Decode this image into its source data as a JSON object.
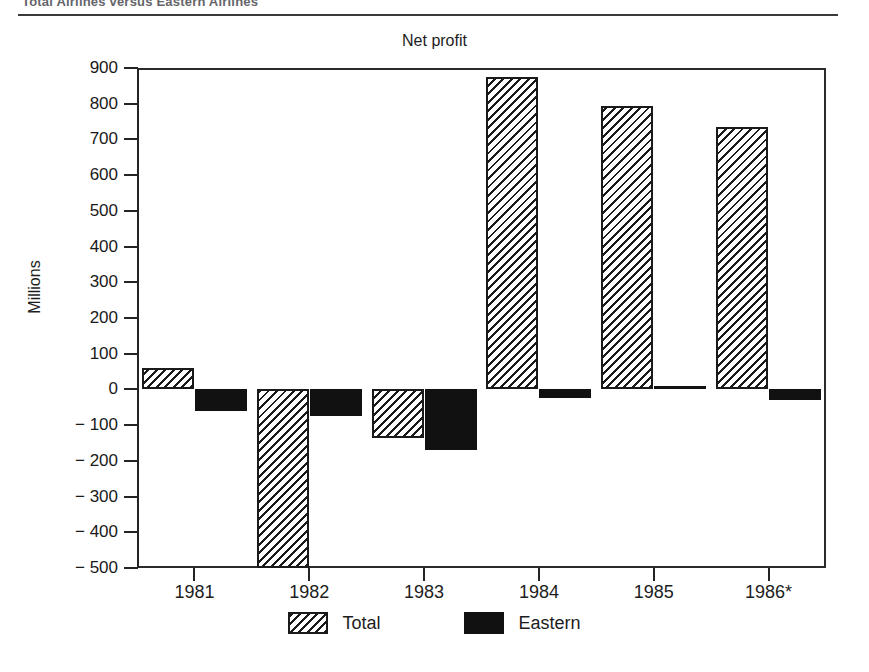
{
  "header": {
    "running_title": "Total Airlines versus Eastern Airlines"
  },
  "chart_data": {
    "type": "bar",
    "title": "Net profit",
    "xlabel": "",
    "ylabel": "Millions",
    "categories": [
      "1981",
      "1982",
      "1983",
      "1984",
      "1985",
      "1986*"
    ],
    "ylim": [
      -500,
      900
    ],
    "yticks": [
      900,
      800,
      700,
      600,
      500,
      400,
      300,
      200,
      100,
      0,
      -100,
      -200,
      -300,
      -400,
      -500
    ],
    "ytick_labels": [
      "900",
      "800",
      "700",
      "600",
      "500",
      "400",
      "300",
      "200",
      "100",
      "0",
      "− 100",
      "− 200",
      "− 300",
      "− 400",
      "− 500"
    ],
    "grid": false,
    "legend_position": "bottom",
    "series": [
      {
        "name": "Total",
        "fill": "diagonal-hatch",
        "values": [
          60,
          -720,
          -135,
          875,
          795,
          735
        ],
        "clipped": [
          false,
          true,
          false,
          false,
          false,
          false
        ],
        "clip_note": "1982 Total bar extends below the -500 axis floor and is drawn truncated"
      },
      {
        "name": "Eastern",
        "fill": "solid-black",
        "values": [
          -60,
          -75,
          -170,
          -25,
          10,
          -30
        ],
        "clipped": [
          false,
          false,
          false,
          false,
          false,
          false
        ]
      }
    ],
    "footnote_marker": "*",
    "colors": {
      "ink": "#1a1a1a",
      "total_fill": "#ffffff",
      "total_hatch": "#1a1a1a",
      "eastern_fill": "#111111",
      "background": "#ffffff"
    }
  },
  "legend": {
    "items": [
      {
        "label": "Total"
      },
      {
        "label": "Eastern"
      }
    ]
  }
}
